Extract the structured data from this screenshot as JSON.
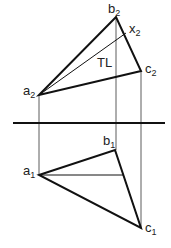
{
  "diagram": {
    "type": "descriptive geometry true-length construction",
    "top_view": {
      "label": "front view (2)",
      "points": {
        "a2": {
          "x": 39,
          "y": 95,
          "label": "a",
          "sub": "2"
        },
        "b2": {
          "x": 116,
          "y": 17,
          "label": "b",
          "sub": "2"
        },
        "c2": {
          "x": 141,
          "y": 71,
          "label": "c",
          "sub": "2"
        },
        "x2": {
          "x": 126,
          "y": 33,
          "label": "x",
          "sub": "2"
        }
      },
      "tl_label": "TL"
    },
    "fold_line": {
      "y": 123,
      "x1": 13,
      "x2": 165
    },
    "bottom_view": {
      "label": "top view (1)",
      "points": {
        "a1": {
          "x": 39,
          "y": 175,
          "label": "a",
          "sub": "1"
        },
        "b1": {
          "x": 115,
          "y": 150,
          "label": "b",
          "sub": "1"
        },
        "c1": {
          "x": 141,
          "y": 228,
          "label": "c",
          "sub": "1"
        }
      }
    },
    "colors": {
      "line": "#111111",
      "background": "#ffffff"
    }
  }
}
